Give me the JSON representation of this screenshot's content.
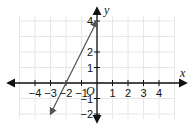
{
  "chart_data": {
    "type": "line",
    "title": "",
    "xlabel": "x",
    "ylabel": "y",
    "origin_label": "O",
    "xlim": [
      -5,
      5
    ],
    "ylim": [
      -2.3,
      4.3
    ],
    "grid": true,
    "legend": null,
    "x_ticks": [
      -4,
      -3,
      -2,
      -1,
      1,
      2,
      3,
      4
    ],
    "x_tick_labels": [
      "−4",
      "−3",
      "−2",
      "−1",
      "1",
      "2",
      "3",
      "4"
    ],
    "y_ticks": [
      4,
      2,
      1,
      -1,
      -2
    ],
    "y_tick_labels": [
      "4",
      "2",
      "1",
      "−1",
      "−2"
    ],
    "series": [
      {
        "name": "line",
        "equation": "y = 2x + 4",
        "slope": 2,
        "y_intercept": 4,
        "x_intercept": -2,
        "x": [
          -3,
          0
        ],
        "y": [
          -2,
          4
        ],
        "arrows_both_ends": true,
        "color": "#555555"
      }
    ]
  },
  "colors": {
    "axis": "#111111",
    "grid": "#e6e6e6",
    "line": "#555555"
  }
}
